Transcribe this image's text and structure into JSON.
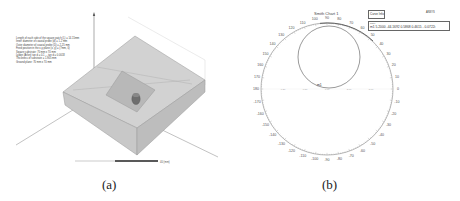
{
  "figure": {
    "panel_a": {
      "caption": "(a)",
      "parameters": [
        "Length of each side of the square patch (L) = 14.15mm",
        "Inner diameter of coaxial probe (d) = 1.2 mm",
        "Outer diameter of coaxial probe (D) = 2.25 mm",
        "Feed position in the x-y plane (x, y) = (7mm, 0)",
        "Square substrate: 70 mm x 70 mm",
        "Lydon (Arlon) tan d = 0.1 ... tan d = 0.0018",
        "Thickness of substrate = 1.905 mm",
        "Ground plane: 70 mm x 70 mm"
      ],
      "scale_bar": {
        "left": "0",
        "mid": "",
        "right": "40 (mm)"
      }
    },
    "panel_b": {
      "caption": "(b)"
    }
  },
  "chart_data": {
    "type": "smith",
    "title": "Smith Chart 1",
    "angle_ticks_deg": [
      0,
      10,
      20,
      30,
      40,
      50,
      60,
      70,
      80,
      90,
      100,
      110,
      120,
      130,
      140,
      150,
      160,
      170,
      180,
      -170,
      -160,
      -150,
      -140,
      -130,
      -120,
      -110,
      -100,
      -90,
      -80,
      -70,
      -60,
      -50,
      -40,
      -30,
      -20,
      -10
    ],
    "real_axis_ticks": [
      "0.20",
      "0.50",
      "1.00",
      "2.00",
      "5.00"
    ],
    "marker": {
      "name": "m1",
      "freq": "5.2000",
      "ang": "-44.1692",
      "mag": "0.5868",
      "RX": "0.4615 - 0.0722i"
    },
    "legend": {
      "header": [
        "Name",
        "Freq",
        "Ang",
        "Mag",
        "RX"
      ],
      "row": [
        "m1",
        "5.2000",
        "-44.1692",
        "0.5868",
        "0.4615 - 0.0722i"
      ],
      "trace_label": "Curve Info",
      "corner_label": "ANSYS"
    },
    "curves": [
      {
        "name": "S11 locus",
        "shape": "circle",
        "description": "loop in upper half of chart near unit circle top"
      }
    ]
  }
}
